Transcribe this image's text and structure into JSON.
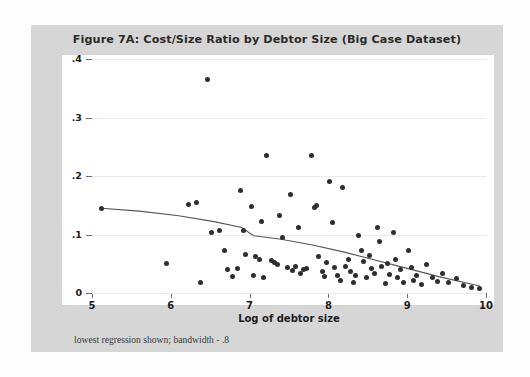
{
  "figure": {
    "title": "Figure 7A:  Cost/Size Ratio by Debtor Size (Big Case Dataset)",
    "note": "lowest regression shown; bandwidth - .8"
  },
  "axes": {
    "ylabel": "Total cost over size",
    "xlabel": "Log of debtor size",
    "yticks": [
      "0",
      ".1",
      ".2",
      ".3",
      ".4"
    ],
    "xticks": [
      "5",
      "6",
      "7",
      "8",
      "9",
      "10"
    ]
  },
  "colors": {
    "panel": "#d6d6d6",
    "plot_bg": "#ffffff",
    "marker": "#2e2e2e",
    "grid": "#e9e9e9",
    "axis": "#6d6d6d",
    "curve": "#555555"
  },
  "chart_data": {
    "type": "scatter",
    "title": "Figure 7A:  Cost/Size Ratio by Debtor Size (Big Case Dataset)",
    "xlabel": "Log of debtor size",
    "ylabel": "Total cost over size",
    "xlim": [
      5,
      10
    ],
    "ylim": [
      0,
      0.4
    ],
    "grid": true,
    "legend": false,
    "annotation": "lowest regression shown; bandwidth - .8",
    "points": [
      [
        5.12,
        0.145
      ],
      [
        5.95,
        0.05
      ],
      [
        6.23,
        0.152
      ],
      [
        6.32,
        0.155
      ],
      [
        6.38,
        0.018
      ],
      [
        6.47,
        0.365
      ],
      [
        6.52,
        0.104
      ],
      [
        6.62,
        0.106
      ],
      [
        6.68,
        0.072
      ],
      [
        6.72,
        0.04
      ],
      [
        6.78,
        0.028
      ],
      [
        6.85,
        0.042
      ],
      [
        6.88,
        0.175
      ],
      [
        6.92,
        0.106
      ],
      [
        6.95,
        0.066
      ],
      [
        7.02,
        0.148
      ],
      [
        7.05,
        0.03
      ],
      [
        7.08,
        0.062
      ],
      [
        7.12,
        0.058
      ],
      [
        7.15,
        0.122
      ],
      [
        7.18,
        0.026
      ],
      [
        7.22,
        0.235
      ],
      [
        7.28,
        0.056
      ],
      [
        7.32,
        0.052
      ],
      [
        7.35,
        0.048
      ],
      [
        7.38,
        0.132
      ],
      [
        7.42,
        0.095
      ],
      [
        7.48,
        0.044
      ],
      [
        7.52,
        0.168
      ],
      [
        7.55,
        0.038
      ],
      [
        7.58,
        0.046
      ],
      [
        7.62,
        0.112
      ],
      [
        7.65,
        0.034
      ],
      [
        7.68,
        0.04
      ],
      [
        7.72,
        0.042
      ],
      [
        7.78,
        0.235
      ],
      [
        7.82,
        0.146
      ],
      [
        7.85,
        0.15
      ],
      [
        7.88,
        0.062
      ],
      [
        7.92,
        0.036
      ],
      [
        7.95,
        0.028
      ],
      [
        7.98,
        0.052
      ],
      [
        8.02,
        0.19
      ],
      [
        8.05,
        0.12
      ],
      [
        8.08,
        0.044
      ],
      [
        8.12,
        0.03
      ],
      [
        8.15,
        0.022
      ],
      [
        8.18,
        0.18
      ],
      [
        8.22,
        0.046
      ],
      [
        8.25,
        0.058
      ],
      [
        8.28,
        0.036
      ],
      [
        8.32,
        0.018
      ],
      [
        8.35,
        0.03
      ],
      [
        8.38,
        0.098
      ],
      [
        8.42,
        0.072
      ],
      [
        8.45,
        0.054
      ],
      [
        8.48,
        0.026
      ],
      [
        8.52,
        0.064
      ],
      [
        8.55,
        0.042
      ],
      [
        8.58,
        0.034
      ],
      [
        8.62,
        0.112
      ],
      [
        8.65,
        0.088
      ],
      [
        8.68,
        0.046
      ],
      [
        8.72,
        0.016
      ],
      [
        8.75,
        0.05
      ],
      [
        8.78,
        0.032
      ],
      [
        8.82,
        0.104
      ],
      [
        8.85,
        0.058
      ],
      [
        8.88,
        0.026
      ],
      [
        8.92,
        0.04
      ],
      [
        8.95,
        0.018
      ],
      [
        9.02,
        0.072
      ],
      [
        9.05,
        0.044
      ],
      [
        9.08,
        0.022
      ],
      [
        9.12,
        0.03
      ],
      [
        9.18,
        0.014
      ],
      [
        9.25,
        0.048
      ],
      [
        9.32,
        0.026
      ],
      [
        9.38,
        0.02
      ],
      [
        9.45,
        0.034
      ],
      [
        9.52,
        0.018
      ],
      [
        9.62,
        0.024
      ],
      [
        9.72,
        0.012
      ],
      [
        9.82,
        0.01
      ],
      [
        9.92,
        0.008
      ]
    ],
    "regression_line": {
      "label": "lowess",
      "bandwidth": 0.8,
      "x": [
        5.12,
        5.6,
        6.1,
        6.55,
        6.9,
        7.05,
        7.4,
        7.8,
        8.2,
        8.6,
        9.0,
        9.4,
        9.92
      ],
      "y": [
        0.145,
        0.14,
        0.132,
        0.122,
        0.112,
        0.098,
        0.092,
        0.082,
        0.07,
        0.056,
        0.042,
        0.028,
        0.012
      ]
    }
  }
}
